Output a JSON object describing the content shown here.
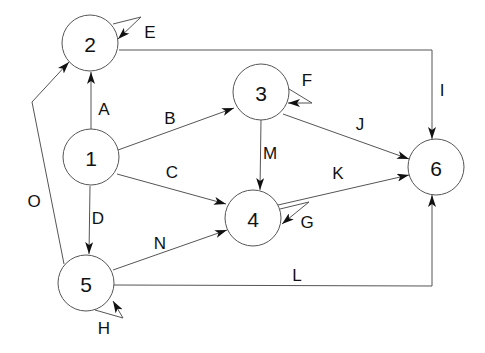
{
  "diagram": {
    "type": "directed-graph",
    "nodes": [
      {
        "id": "1",
        "label": "1",
        "x": 91,
        "y": 157
      },
      {
        "id": "2",
        "label": "2",
        "x": 90,
        "y": 43
      },
      {
        "id": "3",
        "label": "3",
        "x": 261,
        "y": 92
      },
      {
        "id": "4",
        "label": "4",
        "x": 253,
        "y": 218
      },
      {
        "id": "5",
        "label": "5",
        "x": 86,
        "y": 283
      },
      {
        "id": "6",
        "label": "6",
        "x": 436,
        "y": 167
      }
    ],
    "node_radius": 28,
    "edges": [
      {
        "id": "A",
        "label": "A",
        "from": "1",
        "to": "2",
        "points": [
          [
            91,
            129
          ],
          [
            91,
            72
          ]
        ],
        "label_pos": [
          104,
          109
        ]
      },
      {
        "id": "B",
        "label": "B",
        "from": "1",
        "to": "3",
        "points": [
          [
            118,
            150
          ],
          [
            234,
            108
          ]
        ],
        "label_pos": [
          170,
          118
        ]
      },
      {
        "id": "C",
        "label": "C",
        "from": "1",
        "to": "4",
        "points": [
          [
            117,
            174
          ],
          [
            226,
            204
          ]
        ],
        "label_pos": [
          172,
          172
        ]
      },
      {
        "id": "D",
        "label": "D",
        "from": "1",
        "to": "5",
        "points": [
          [
            90,
            186
          ],
          [
            89,
            254
          ]
        ],
        "label_pos": [
          98,
          218
        ]
      },
      {
        "id": "E",
        "label": "E",
        "from": "2",
        "to": "2",
        "points": [
          [
            113,
            24
          ],
          [
            141,
            17
          ],
          [
            118,
            39
          ]
        ],
        "label_pos": [
          150,
          32
        ]
      },
      {
        "id": "F",
        "label": "F",
        "from": "3",
        "to": "3",
        "points": [
          [
            289,
            89
          ],
          [
            312,
            103
          ],
          [
            288,
            103
          ]
        ],
        "label_pos": [
          307,
          80
        ]
      },
      {
        "id": "G",
        "label": "G",
        "from": "4",
        "to": "4",
        "points": [
          [
            280,
            209
          ],
          [
            309,
            202
          ],
          [
            282,
            224
          ]
        ],
        "label_pos": [
          307,
          222
        ]
      },
      {
        "id": "H",
        "label": "H",
        "from": "5",
        "to": "5",
        "points": [
          [
            95,
            310
          ],
          [
            123,
            318
          ],
          [
            113,
            301
          ]
        ],
        "label_pos": [
          104,
          328
        ]
      },
      {
        "id": "I",
        "label": "I",
        "from": "2",
        "to": "6",
        "points": [
          [
            119,
            50
          ],
          [
            432,
            50
          ],
          [
            432,
            139
          ]
        ],
        "label_pos": [
          442,
          90
        ]
      },
      {
        "id": "J",
        "label": "J",
        "from": "3",
        "to": "6",
        "points": [
          [
            283,
            114
          ],
          [
            409,
            159
          ]
        ],
        "label_pos": [
          360,
          124
        ]
      },
      {
        "id": "K",
        "label": "K",
        "from": "4",
        "to": "6",
        "points": [
          [
            278,
            205
          ],
          [
            409,
            175
          ]
        ],
        "label_pos": [
          338,
          173
        ]
      },
      {
        "id": "L",
        "label": "L",
        "from": "5",
        "to": "6",
        "points": [
          [
            114,
            285
          ],
          [
            432,
            286
          ],
          [
            432,
            195
          ]
        ],
        "label_pos": [
          297,
          275
        ]
      },
      {
        "id": "M",
        "label": "M",
        "from": "3",
        "to": "4",
        "points": [
          [
            261,
            120
          ],
          [
            260,
            190
          ]
        ],
        "label_pos": [
          270,
          153
        ]
      },
      {
        "id": "N",
        "label": "N",
        "from": "5",
        "to": "4",
        "points": [
          [
            113,
            270
          ],
          [
            227,
            230
          ]
        ],
        "label_pos": [
          160,
          243
        ]
      },
      {
        "id": "O",
        "label": "O",
        "from": "5",
        "to": "2",
        "points": [
          [
            64,
            264
          ],
          [
            32,
            102
          ],
          [
            69,
            62
          ]
        ],
        "label_pos": [
          34,
          201
        ]
      }
    ]
  },
  "colors": {
    "stroke": "#555555",
    "text": "#111111",
    "background": "#ffffff"
  }
}
